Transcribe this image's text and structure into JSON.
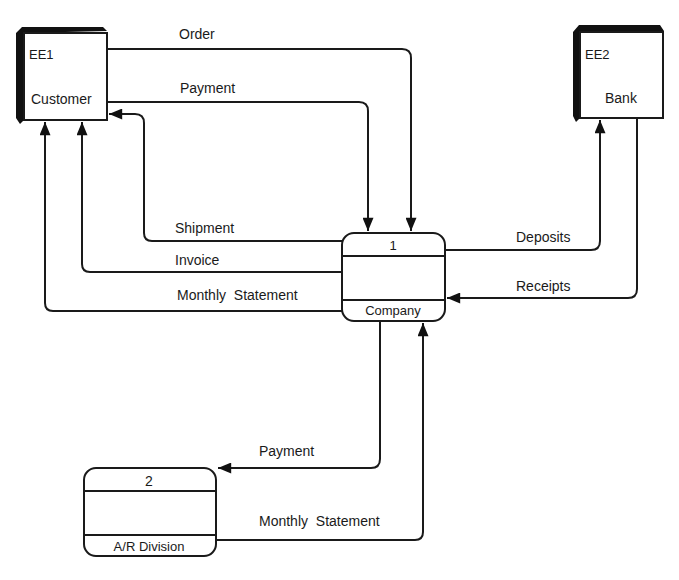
{
  "diagram": {
    "type": "data-flow-diagram",
    "external_entities": [
      {
        "id": "EE1",
        "label": "Customer"
      },
      {
        "id": "EE2",
        "label": "Bank"
      }
    ],
    "processes": [
      {
        "id": "1",
        "label": "Company"
      },
      {
        "id": "2",
        "label": "A/R Division"
      }
    ],
    "flows": [
      {
        "label": "Order",
        "from": "Customer",
        "to": "Company"
      },
      {
        "label": "Payment",
        "from": "Customer",
        "to": "Company"
      },
      {
        "label": "Shipment",
        "from": "Company",
        "to": "Customer"
      },
      {
        "label": "Invoice",
        "from": "Company",
        "to": "Customer"
      },
      {
        "label": "Monthly  Statement",
        "from": "Company",
        "to": "Customer"
      },
      {
        "label": "Deposits",
        "from": "Company",
        "to": "Bank"
      },
      {
        "label": "Receipts",
        "from": "Bank",
        "to": "Company"
      },
      {
        "label": "Payment",
        "from": "Company",
        "to": "A/R Division"
      },
      {
        "label": "Monthly  Statement",
        "from": "A/R Division",
        "to": "Company"
      }
    ],
    "colors": {
      "line": "#1a1a1a",
      "background": "#ffffff"
    }
  }
}
